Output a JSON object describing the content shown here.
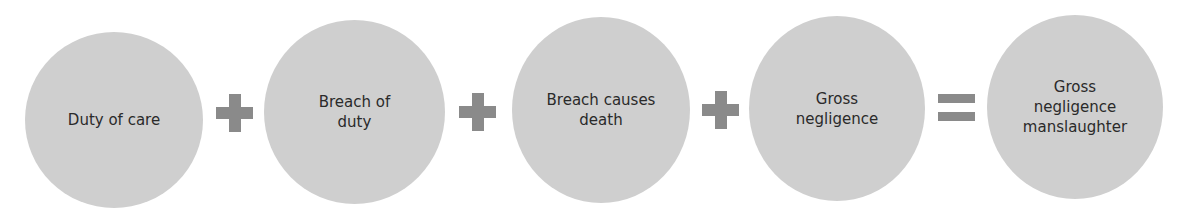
{
  "diagram": {
    "type": "equation-flow",
    "terms": [
      {
        "label": "Duty of care"
      },
      {
        "label": "Breach of\nduty"
      },
      {
        "label": "Breach causes\ndeath"
      },
      {
        "label": "Gross\nnegligence"
      },
      {
        "label": "Gross\nnegligence\nmanslaughter"
      }
    ],
    "operators": [
      "plus",
      "plus",
      "plus",
      "equals"
    ],
    "colors": {
      "circle_fill": "#cfcfcf",
      "operator": "#8a8a8a",
      "text": "#2a2a2a"
    }
  }
}
